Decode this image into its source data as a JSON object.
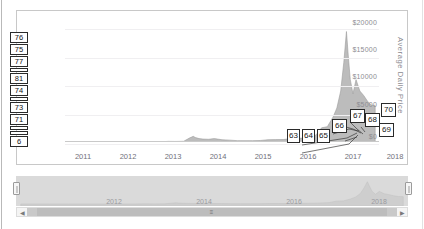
{
  "chart_data": {
    "type": "area",
    "title": "",
    "xlabel": "",
    "ylabel": "Average Daily Price",
    "ylim": [
      0,
      21000
    ],
    "xlim": [
      2010.6,
      2018.8
    ],
    "grid": true,
    "legend": "none",
    "y_ticks": [
      "$0",
      "$5000",
      "$10000",
      "$15000",
      "$20000"
    ],
    "y_tick_values": [
      0,
      5000,
      10000,
      15000,
      20000
    ],
    "x_ticks": [
      "2011",
      "2012",
      "2013",
      "2014",
      "2015",
      "2016",
      "2017",
      "2018"
    ],
    "x_tick_values": [
      2011,
      2012,
      2013,
      2014,
      2015,
      2016,
      2017,
      2018
    ],
    "series": [
      {
        "name": "Average Daily Price",
        "x": [
          2010.7,
          2011.0,
          2011.3,
          2011.5,
          2011.7,
          2012.0,
          2012.3,
          2012.6,
          2012.9,
          2013.1,
          2013.3,
          2013.5,
          2013.7,
          2013.85,
          2013.95,
          2014.0,
          2014.1,
          2014.2,
          2014.35,
          2014.5,
          2014.7,
          2014.9,
          2015.1,
          2015.3,
          2015.5,
          2015.7,
          2015.9,
          2016.1,
          2016.3,
          2016.5,
          2016.7,
          2016.9,
          2017.0,
          2017.15,
          2017.3,
          2017.45,
          2017.6,
          2017.7,
          2017.8,
          2017.88,
          2017.95,
          2018.0,
          2018.05,
          2018.12,
          2018.2,
          2018.3,
          2018.4,
          2018.5,
          2018.6,
          2018.7
        ],
        "y": [
          1,
          5,
          15,
          8,
          3,
          5,
          7,
          11,
          13,
          40,
          110,
          95,
          125,
          700,
          1000,
          800,
          600,
          520,
          480,
          600,
          400,
          330,
          240,
          235,
          240,
          265,
          400,
          420,
          430,
          600,
          640,
          740,
          980,
          1200,
          2500,
          2700,
          4400,
          6000,
          9000,
          14000,
          19500,
          15000,
          11000,
          8500,
          11000,
          9000,
          8200,
          7200,
          6500,
          6400
        ]
      }
    ],
    "area_fill": "#b0b0b0",
    "peak": {
      "value": 19500,
      "approx_date": "2017-12"
    }
  },
  "chart_panel": {
    "y_axis_title": "Average Daily Price",
    "y_tick_labels": [
      "$20000",
      "$15000",
      "$10000",
      "$5000",
      "$0"
    ],
    "x_tick_labels": [
      "2011",
      "2012",
      "2013",
      "2014",
      "2015",
      "2016",
      "2017",
      "2018"
    ]
  },
  "callouts": [
    {
      "id": "63",
      "label": "63"
    },
    {
      "id": "64",
      "label": "64"
    },
    {
      "id": "65",
      "label": "65"
    },
    {
      "id": "66",
      "label": "66"
    },
    {
      "id": "67",
      "label": "67"
    },
    {
      "id": "68",
      "label": "68"
    },
    {
      "id": "69",
      "label": "69"
    },
    {
      "id": "70",
      "label": "70"
    }
  ],
  "left_stack": {
    "upper": [
      {
        "label": "76",
        "squish": false
      },
      {
        "label": "75",
        "squish": false
      },
      {
        "label": "77",
        "squish": false
      },
      {
        "label": "",
        "squish": true
      },
      {
        "label": "81",
        "squish": false
      },
      {
        "label": "74",
        "squish": false
      },
      {
        "label": "",
        "squish": true
      },
      {
        "label": "73",
        "squish": false
      },
      {
        "label": "71",
        "squish": false
      }
    ],
    "lower": [
      {
        "label": "",
        "squish": true
      },
      {
        "label": "",
        "squish": true
      },
      {
        "label": "6",
        "squish": false
      }
    ]
  },
  "navigator": {
    "x_tick_labels": [
      "2012",
      "2014",
      "2016",
      "2018"
    ],
    "handle_left_name": "left-handle",
    "handle_right_name": "right-handle"
  },
  "scrollbar": {
    "left_arrow": "◀",
    "right_arrow": "▶",
    "grip": "≡"
  },
  "cutoff_text": "",
  "colors": {
    "area": "#b0b0b0",
    "grid": "#f0eff1",
    "axis": "#c9c9c9",
    "text": "#70707a",
    "callout_border": "#2a2a2a",
    "navigator_mask": "#d2d2d2"
  }
}
